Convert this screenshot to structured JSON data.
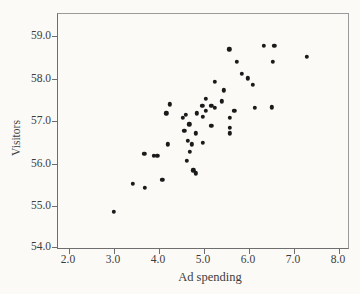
{
  "figure": {
    "background": "#fbfaf7",
    "axis_color_light": "#9a9a9a",
    "axis_color_dark": "#6e6e6e",
    "text_color": "#3c3c3c",
    "dot_color": "#1a1a1a"
  },
  "chart_data": {
    "type": "scatter",
    "title": "",
    "xlabel": "Ad spending",
    "ylabel": "Visitors",
    "xlim": [
      1.756,
      8.2
    ],
    "ylim": [
      54.02,
      59.52
    ],
    "grid": false,
    "legend": "none",
    "x_ticks": {
      "values": [
        2.0,
        3.0,
        4.0,
        5.0,
        6.0,
        7.0,
        8.0
      ],
      "labels": [
        "2.0",
        "3.0",
        "4.0",
        "5.0",
        "6.0",
        "7.0",
        "8.0"
      ]
    },
    "y_ticks": {
      "values": [
        59.0,
        58.0,
        57.0,
        56.0,
        55.0,
        54.0
      ],
      "labels": [
        "59.0",
        "58.0",
        "57.0",
        "56.0",
        "55.0",
        "54.0"
      ]
    },
    "points": [
      [
        6.33,
        58.77
      ],
      [
        6.56,
        58.77
      ],
      [
        5.56,
        58.69
      ],
      [
        7.29,
        58.51
      ],
      [
        5.73,
        58.39
      ],
      [
        6.53,
        58.39
      ],
      [
        5.84,
        58.11
      ],
      [
        5.98,
        58.01
      ],
      [
        5.24,
        57.92
      ],
      [
        6.09,
        57.85
      ],
      [
        5.44,
        57.73
      ],
      [
        4.24,
        57.4
      ],
      [
        4.16,
        57.19
      ],
      [
        5.04,
        57.52
      ],
      [
        5.4,
        57.47
      ],
      [
        4.96,
        57.36
      ],
      [
        5.16,
        57.36
      ],
      [
        5.24,
        57.31
      ],
      [
        5.04,
        57.24
      ],
      [
        4.84,
        57.19
      ],
      [
        4.6,
        57.15
      ],
      [
        4.53,
        57.08
      ],
      [
        4.98,
        57.1
      ],
      [
        5.67,
        57.24
      ],
      [
        5.58,
        57.08
      ],
      [
        4.67,
        56.93
      ],
      [
        5.16,
        56.89
      ],
      [
        5.58,
        56.84
      ],
      [
        5.58,
        56.72
      ],
      [
        4.82,
        56.72
      ],
      [
        4.56,
        56.77
      ],
      [
        6.13,
        57.31
      ],
      [
        6.51,
        57.33
      ],
      [
        4.2,
        56.46
      ],
      [
        4.64,
        56.54
      ],
      [
        4.73,
        56.46
      ],
      [
        4.98,
        56.49
      ],
      [
        3.67,
        56.23
      ],
      [
        3.89,
        56.18
      ],
      [
        3.96,
        56.18
      ],
      [
        4.69,
        56.28
      ],
      [
        4.62,
        56.07
      ],
      [
        4.76,
        55.85
      ],
      [
        4.82,
        55.78
      ],
      [
        4.07,
        55.62
      ],
      [
        3.42,
        55.53
      ],
      [
        3.69,
        55.43
      ],
      [
        3.0,
        54.87
      ]
    ]
  }
}
